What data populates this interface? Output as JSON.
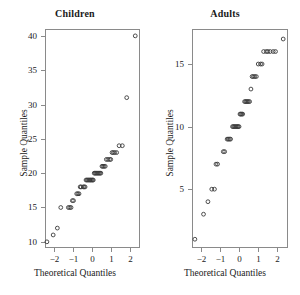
{
  "figure": {
    "background": "#ffffff",
    "marker_color": "#3a3a3a",
    "frame_color": "#8a8a8a",
    "text_color": "#1a1a1a"
  },
  "panels": [
    {
      "id": "children",
      "title": "Children",
      "xlabel": "Theoretical Quantiles",
      "ylabel": "Sample Quantiles",
      "xticks": [
        -2,
        -1,
        0,
        1,
        2
      ],
      "xtick_labels": [
        "−2",
        "−1",
        "0",
        "1",
        "2"
      ],
      "yticks": [
        10,
        15,
        20,
        25,
        30,
        35,
        40
      ],
      "ytick_labels": [
        "10",
        "15",
        "20",
        "25",
        "30",
        "35",
        "40"
      ],
      "xlim": [
        -2.45,
        2.55
      ],
      "ylim": [
        9.1,
        41.0
      ]
    },
    {
      "id": "adults",
      "title": "Adults",
      "xlabel": "Theoretical Quantiles",
      "ylabel": "Sample Quantiles",
      "xticks": [
        -2,
        -1,
        0,
        1,
        2
      ],
      "xtick_labels": [
        "−2",
        "−1",
        "0",
        "1",
        "2"
      ],
      "yticks": [
        5,
        10,
        15
      ],
      "ytick_labels": [
        "5",
        "10",
        "15"
      ],
      "xlim": [
        -2.45,
        2.55
      ],
      "ylim": [
        0.3,
        17.8
      ]
    }
  ],
  "chart_data": [
    {
      "type": "scatter",
      "id": "children",
      "title": "Children",
      "xlabel": "Theoretical Quantiles",
      "ylabel": "Sample Quantiles",
      "xlim": [
        -2.45,
        2.55
      ],
      "ylim": [
        9.1,
        41.0
      ],
      "xticks": [
        -2,
        -1,
        0,
        1,
        2
      ],
      "yticks": [
        10,
        15,
        20,
        25,
        30,
        35,
        40
      ],
      "grid": false,
      "legend": "none",
      "marker": "open-circle",
      "x": [
        -2.35,
        -2.02,
        -1.8,
        -1.62,
        -1.22,
        -1.15,
        -1.08,
        -1.01,
        -0.95,
        -0.78,
        -0.72,
        -0.66,
        -0.6,
        -0.55,
        -0.44,
        -0.39,
        -0.34,
        -0.29,
        -0.24,
        -0.19,
        -0.14,
        -0.09,
        -0.05,
        0.0,
        0.05,
        0.09,
        0.14,
        0.19,
        0.24,
        0.29,
        0.34,
        0.39,
        0.44,
        0.49,
        0.55,
        0.6,
        0.66,
        0.72,
        0.78,
        0.86,
        0.95,
        1.01,
        1.08,
        1.15,
        1.22,
        1.32,
        1.45,
        1.62,
        1.85,
        2.3
      ],
      "y": [
        10,
        11,
        12,
        15,
        15,
        15,
        15,
        16,
        16,
        17,
        17,
        17,
        18,
        18,
        18,
        18,
        18,
        19,
        19,
        19,
        19,
        19,
        19,
        19,
        19,
        19,
        20,
        20,
        20,
        20,
        20,
        20,
        20,
        20,
        21,
        21,
        21,
        21,
        22,
        22,
        22,
        22,
        23,
        23,
        23,
        23,
        24,
        24,
        31,
        40
      ]
    },
    {
      "type": "scatter",
      "id": "adults",
      "title": "Adults",
      "xlabel": "Theoretical Quantiles",
      "ylabel": "Sample Quantiles",
      "xlim": [
        -2.45,
        2.55
      ],
      "ylim": [
        0.3,
        17.8
      ],
      "xticks": [
        -2,
        -1,
        0,
        1,
        2
      ],
      "yticks": [
        5,
        10,
        15
      ],
      "grid": false,
      "legend": "none",
      "marker": "open-circle",
      "x": [
        -2.3,
        -1.85,
        -1.62,
        -1.42,
        -1.28,
        -1.2,
        -1.12,
        -0.82,
        -0.75,
        -0.62,
        -0.56,
        -0.5,
        -0.44,
        -0.34,
        -0.29,
        -0.24,
        -0.19,
        -0.14,
        -0.09,
        -0.05,
        0.0,
        0.05,
        0.09,
        0.14,
        0.19,
        0.29,
        0.34,
        0.39,
        0.44,
        0.49,
        0.55,
        0.62,
        0.68,
        0.75,
        0.82,
        0.9,
        1.0,
        1.12,
        1.2,
        1.28,
        1.42,
        1.5,
        1.62,
        1.78,
        1.9,
        2.3
      ],
      "y": [
        1,
        3,
        4,
        5,
        5,
        7,
        7,
        8,
        8,
        9,
        9,
        9,
        9,
        10,
        10,
        10,
        10,
        10,
        10,
        10,
        10,
        11,
        11,
        11,
        11,
        12,
        12,
        12,
        12,
        12,
        12,
        13,
        14,
        14,
        14,
        14,
        15,
        15,
        15,
        16,
        16,
        16,
        16,
        16,
        16,
        17
      ]
    }
  ]
}
